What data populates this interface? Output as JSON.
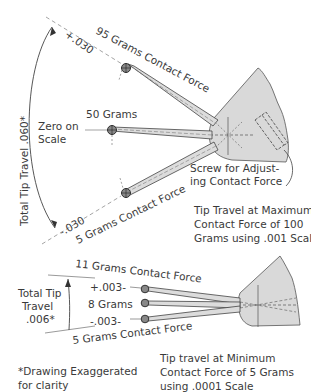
{
  "top_diagram": {
    "total_tip_travel_label": "Total Tip Travel .060*",
    "plus_mark": "+.030",
    "minus_mark": "-.030",
    "upper_force_label": "95 Grams Contact Force",
    "center_force_label": "50 Grams",
    "zero_label_line1": "Zero on",
    "zero_label_line2": "Scale",
    "lower_force_label": "5 Grams Contact Force",
    "screw_label_line1": "Screw for Adjust-",
    "screw_label_line2": "ing Contact Force",
    "caption_line1": "Tip Travel at Maximum",
    "caption_line2": "Contact Force of 100",
    "caption_line3": "Grams using .001 Scale"
  },
  "bottom_diagram": {
    "upper_force_label": "11 Grams Contact Force",
    "plus_mark": "+.003-",
    "center_force_label": "8 Grams",
    "minus_mark": "-.003-",
    "lower_force_label": "5 Grams Contact Force",
    "total_label_line1": "Total Tip",
    "total_label_line2": "Travel",
    "total_label_line3": ".006*",
    "caption_line1": "Tip travel at Minimum",
    "caption_line2": "Contact Force of 5 Grams",
    "caption_line3": "using .0001 Scale"
  },
  "footnote": {
    "line1": "*Drawing Exaggerated",
    "line2": "for clarity"
  },
  "colors": {
    "ink": "#3a3a3a",
    "body_fill": "#d9d9d9",
    "arm_fill": "#dcdcdc"
  }
}
